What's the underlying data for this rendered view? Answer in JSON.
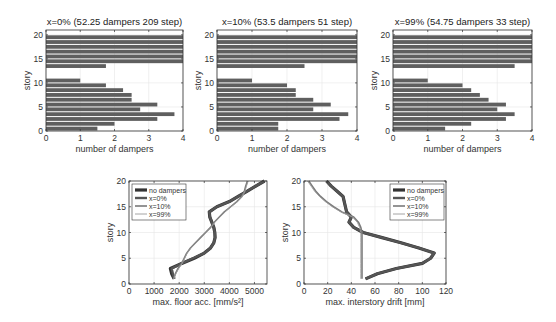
{
  "chart_data": [
    {
      "type": "bar",
      "orientation": "horizontal",
      "title": "x=0% (52.25 dampers 209 step)",
      "xlabel": "number of dampers",
      "ylabel": "story",
      "xlim": [
        0,
        4
      ],
      "ylim": [
        0,
        21
      ],
      "xticks": [
        0,
        1,
        2,
        3,
        4
      ],
      "yticks": [
        0,
        5,
        10,
        15,
        20
      ],
      "grid": true,
      "categories": [
        1,
        2,
        3,
        4,
        5,
        6,
        7,
        8,
        9,
        10,
        11,
        12,
        13,
        14,
        15,
        16,
        17,
        18,
        19,
        20
      ],
      "values": [
        1.5,
        2,
        3.25,
        3.75,
        2.75,
        3.25,
        2.5,
        2.5,
        2.25,
        1.75,
        1,
        0,
        0,
        1.75,
        4,
        4,
        4,
        4,
        4,
        4
      ]
    },
    {
      "type": "bar",
      "orientation": "horizontal",
      "title": "x=10% (53.5 dampers 51 step)",
      "xlabel": "number of dampers",
      "ylabel": "story",
      "xlim": [
        0,
        4
      ],
      "ylim": [
        0,
        21
      ],
      "xticks": [
        0,
        1,
        2,
        3,
        4
      ],
      "yticks": [
        0,
        5,
        10,
        15,
        20
      ],
      "grid": true,
      "categories": [
        1,
        2,
        3,
        4,
        5,
        6,
        7,
        8,
        9,
        10,
        11,
        12,
        13,
        14,
        15,
        16,
        17,
        18,
        19,
        20
      ],
      "values": [
        1.75,
        1.75,
        3.5,
        3.75,
        2.75,
        3.25,
        2.75,
        2.25,
        2.25,
        2,
        1,
        0,
        0,
        2.5,
        4,
        4,
        4,
        4,
        4,
        4
      ]
    },
    {
      "type": "bar",
      "orientation": "horizontal",
      "title": "x=99% (54.75 dampers 33 step)",
      "xlabel": "number of dampers",
      "ylabel": "story",
      "xlim": [
        0,
        4
      ],
      "ylim": [
        0,
        21
      ],
      "xticks": [
        0,
        1,
        2,
        3,
        4
      ],
      "yticks": [
        0,
        5,
        10,
        15,
        20
      ],
      "grid": true,
      "categories": [
        1,
        2,
        3,
        4,
        5,
        6,
        7,
        8,
        9,
        10,
        11,
        12,
        13,
        14,
        15,
        16,
        17,
        18,
        19,
        20
      ],
      "values": [
        1.5,
        2.25,
        3.25,
        3.5,
        3,
        3.25,
        2.75,
        2.5,
        2.25,
        2,
        1,
        0,
        0,
        3.5,
        4,
        4,
        4,
        4,
        4,
        4
      ]
    },
    {
      "type": "line",
      "title": "",
      "xlabel": "max. floor acc. [mm/s²]",
      "ylabel": "story",
      "xlim": [
        0,
        5500
      ],
      "ylim": [
        0,
        20
      ],
      "xticks": [
        0,
        1000,
        2000,
        3000,
        4000,
        5000
      ],
      "yticks": [
        0,
        5,
        10,
        15,
        20
      ],
      "grid": true,
      "legend_position": "upper left",
      "y": [
        1,
        2,
        3,
        4,
        5,
        6,
        7,
        8,
        9,
        10,
        11,
        12,
        13,
        14,
        15,
        16,
        17,
        18,
        19,
        20
      ],
      "series": [
        {
          "name": "no dampers",
          "values": [
            1800,
            1700,
            1650,
            2100,
            2600,
            3000,
            3250,
            3380,
            3430,
            3420,
            3380,
            3300,
            3220,
            3200,
            3500,
            4000,
            4350,
            4700,
            5050,
            5400
          ]
        },
        {
          "name": "x=0%",
          "values": [
            1800,
            1750,
            1700,
            2100,
            2550,
            3000,
            3250,
            3380,
            3430,
            3420,
            3380,
            3300,
            3230,
            3200,
            3500,
            4000,
            4350,
            4700,
            5050,
            5400
          ]
        },
        {
          "name": "x=10%",
          "values": [
            1780,
            1850,
            1950,
            2100,
            2200,
            2300,
            2450,
            2650,
            2850,
            3050,
            3250,
            3400,
            3600,
            3800,
            4050,
            4300,
            4500,
            4600,
            4650,
            4720
          ]
        },
        {
          "name": "x=99%",
          "values": [
            1780,
            1870,
            1980,
            2120,
            2220,
            2320,
            2470,
            2670,
            2870,
            3070,
            3270,
            3420,
            3620,
            3820,
            4070,
            4320,
            4520,
            4620,
            4680,
            4750
          ]
        }
      ]
    },
    {
      "type": "line",
      "title": "",
      "xlabel": "max. interstory drift [mm]",
      "ylabel": "story",
      "xlim": [
        0,
        120
      ],
      "ylim": [
        0,
        20
      ],
      "xticks": [
        0,
        20,
        40,
        60,
        80,
        100,
        120
      ],
      "yticks": [
        0,
        5,
        10,
        15,
        20
      ],
      "grid": true,
      "legend_position": "upper right",
      "y": [
        1,
        2,
        3,
        4,
        5,
        6,
        7,
        8,
        9,
        10,
        11,
        12,
        13,
        14,
        15,
        16,
        17,
        18,
        19,
        20
      ],
      "series": [
        {
          "name": "no dampers",
          "values": [
            52,
            62,
            78,
            100,
            107,
            110,
            97,
            82,
            66,
            50,
            42,
            38,
            40,
            36,
            35,
            34,
            33,
            28,
            23,
            19
          ]
        },
        {
          "name": "x=0%",
          "values": [
            52,
            62,
            78,
            100,
            107,
            110,
            97,
            82,
            66,
            50,
            42,
            38,
            40,
            36,
            35,
            34,
            33,
            28,
            23,
            19
          ]
        },
        {
          "name": "x=10%",
          "values": [
            49,
            49,
            49,
            49,
            49,
            49,
            49,
            49,
            49,
            49,
            48,
            46,
            42,
            32,
            25,
            19,
            14,
            10,
            7,
            4
          ]
        },
        {
          "name": "x=99%",
          "values": [
            48,
            48,
            48,
            48,
            48,
            48,
            48,
            48,
            48,
            48,
            47,
            45,
            41,
            31,
            24,
            18,
            13,
            9,
            6,
            3
          ]
        }
      ]
    }
  ],
  "legend": {
    "no_dampers": "no dampers",
    "x0": "x=0%",
    "x10": "x=10%",
    "x99": "x=99%"
  },
  "colors": {
    "bar_fill": "#5f5f5f",
    "no_dampers": "#333333",
    "x0": "#555555",
    "x10": "#7a7a7a",
    "x99": "#9a9a9a",
    "grid": "#e6e6e6",
    "axis": "#333333"
  }
}
